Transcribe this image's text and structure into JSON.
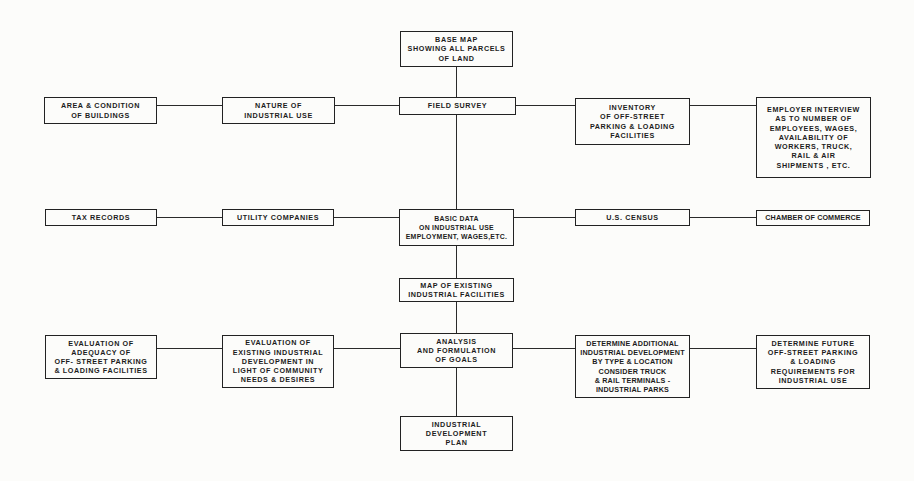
{
  "diagram": {
    "type": "flowchart",
    "boxes": {
      "base_map": "BASE MAP\nSHOWING ALL PARCELS\nOF LAND",
      "area_condition": "AREA & CONDITION\nOF BUILDINGS",
      "nature_use": "NATURE OF\nINDUSTRIAL USE",
      "field_survey": "FIELD SURVEY",
      "inventory": "INVENTORY\nOF OFF-STREET\nPARKING & LOADING\nFACILITIES",
      "employer_interview": "EMPLOYER INTERVIEW\nAS TO NUMBER OF\nEMPLOYEES, WAGES,\nAVAILABILITY OF\nWORKERS, TRUCK,\nRAIL & AIR\nSHIPMENTS , ETC.",
      "tax_records": "TAX RECORDS",
      "utility_companies": "UTILITY COMPANIES",
      "basic_data": "BASIC DATA\nON INDUSTRIAL USE\nEMPLOYMENT, WAGES,ETC.",
      "us_census": "U.S. CENSUS",
      "chamber_commerce": "CHAMBER OF COMMERCE",
      "map_existing": "MAP OF EXISTING\nINDUSTRIAL FACILITIES",
      "eval_adequacy": "EVALUATION OF\nADEQUACY OF\nOFF- STREET PARKING\n& LOADING FACILITIES",
      "eval_existing": "EVALUATION OF\nEXISTING INDUSTRIAL\nDEVELOPMENT IN\nLIGHT OF COMMUNITY\nNEEDS & DESIRES",
      "analysis": "ANALYSIS\nAND FORMULATION\nOF GOALS",
      "determine_additional": "DETERMINE ADDITIONAL\nINDUSTRIAL DEVELOPMENT\nBY TYPE & LOCATION\nCONSIDER TRUCK\n& RAIL TERMINALS -\nINDUSTRIAL PARKS",
      "determine_future": "DETERMINE FUTURE\nOFF-STREET PARKING\n& LOADING\nREQUIREMENTS FOR\nINDUSTRIAL USE",
      "plan": "INDUSTRIAL\nDEVELOPMENT\nPLAN"
    },
    "edges": [
      [
        "base_map",
        "field_survey"
      ],
      [
        "field_survey",
        "basic_data"
      ],
      [
        "basic_data",
        "map_existing"
      ],
      [
        "map_existing",
        "analysis"
      ],
      [
        "analysis",
        "plan"
      ],
      [
        "area_condition",
        "nature_use"
      ],
      [
        "nature_use",
        "field_survey"
      ],
      [
        "field_survey",
        "inventory"
      ],
      [
        "inventory",
        "employer_interview"
      ],
      [
        "tax_records",
        "utility_companies"
      ],
      [
        "utility_companies",
        "basic_data"
      ],
      [
        "basic_data",
        "us_census"
      ],
      [
        "us_census",
        "chamber_commerce"
      ],
      [
        "eval_adequacy",
        "eval_existing"
      ],
      [
        "eval_existing",
        "analysis"
      ],
      [
        "analysis",
        "determine_additional"
      ],
      [
        "determine_additional",
        "determine_future"
      ]
    ]
  }
}
